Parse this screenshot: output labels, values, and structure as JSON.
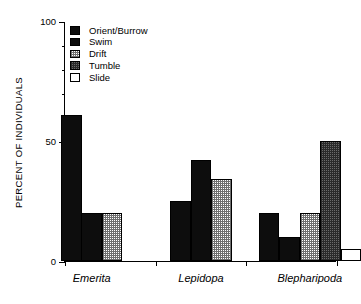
{
  "chart_data": {
    "type": "bar",
    "title": "",
    "xlabel": "",
    "ylabel": "PERCENT OF INDIVIDUALS",
    "ylim": [
      0,
      100
    ],
    "ytick_labels": [
      "0",
      "50",
      "100"
    ],
    "ytick_values": [
      0,
      50,
      100
    ],
    "yminor_step": 10,
    "grid": false,
    "legend_position": "top-left",
    "categories": [
      "Emerita",
      "Lepidopa",
      "Blepharipoda"
    ],
    "series": [
      {
        "name": "Orient/Burrow",
        "fill": "solid",
        "values": [
          61,
          25,
          20
        ]
      },
      {
        "name": "Swim",
        "fill": "solid",
        "values": [
          20,
          42,
          10
        ]
      },
      {
        "name": "Drift",
        "fill": "light-stipple",
        "values": [
          20,
          34,
          20
        ]
      },
      {
        "name": "Tumble",
        "fill": "dark-stipple",
        "values": [
          0,
          0,
          50
        ]
      },
      {
        "name": "Slide",
        "fill": "empty",
        "values": [
          0,
          0,
          5
        ]
      }
    ]
  },
  "legend": {
    "items": [
      {
        "label": "Orient/Burrow",
        "fill": "solid"
      },
      {
        "label": "Swim",
        "fill": "solid"
      },
      {
        "label": "Drift",
        "fill": "light-stipple"
      },
      {
        "label": "Tumble",
        "fill": "dark-stipple"
      },
      {
        "label": "Slide",
        "fill": "empty"
      }
    ]
  },
  "colors": {
    "axis": "#000000",
    "solid": "#0d0d0d",
    "light_stipple": "#b9b9b9",
    "dark_stipple": "#6a6a6a",
    "empty": "#ffffff"
  }
}
